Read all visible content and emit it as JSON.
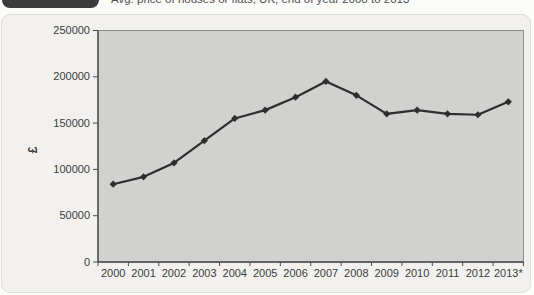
{
  "figure": {
    "title": "Avg. price of houses or flats, UK, end of year 2000 to 2013"
  },
  "chart_data": {
    "type": "line",
    "title": "Avg. price of houses or flats, UK, end of year 2000 to 2013",
    "categories": [
      "2000",
      "2001",
      "2002",
      "2003",
      "2004",
      "2005",
      "2006",
      "2007",
      "2008",
      "2009",
      "2010",
      "2011",
      "2012",
      "2013*"
    ],
    "values": [
      84000,
      92000,
      107000,
      131000,
      155000,
      164000,
      178000,
      195000,
      180000,
      160000,
      164000,
      160000,
      159000,
      173000
    ],
    "series_name": "Average dwelling price",
    "xlabel": "",
    "ylabel": "£",
    "ylim": [
      0,
      250000
    ],
    "ytick_step": 50000,
    "ytick_labels": [
      "0",
      "50000",
      "100000",
      "150000",
      "200000",
      "250000"
    ],
    "grid": false,
    "legend": "none",
    "marker": "diamond",
    "colors": {
      "line": "#2e2e2e",
      "marker": "#2e2e2e",
      "plot_background": "#d1d1cf",
      "plot_border": "#8e8e8c",
      "axis": "#4a4a4a",
      "tick_text": "#3c3c3c",
      "panel_background": "#f2f1ef",
      "badge_background": "#3c3c3c"
    }
  }
}
